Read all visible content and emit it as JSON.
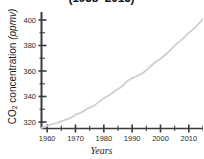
{
  "chart_data": {
    "type": "line",
    "title": "(1958–2015)",
    "xlabel": "Years",
    "ylabel": "CO2 concentration (ppmv)",
    "ylabel_parts": {
      "prefix": "CO",
      "subscript": "2",
      "middle": " concentration ",
      "unit": "(ppmv)"
    },
    "xlim": [
      1958,
      2015
    ],
    "ylim": [
      316,
      410
    ],
    "grid": false,
    "legend": null,
    "line_color": "#cfcfcf",
    "axis_color": "#3a3a3a",
    "x_major_ticks": [
      1960,
      1970,
      1980,
      1990,
      2000,
      2010
    ],
    "x_minor_step": 5,
    "y_major_ticks": [
      320,
      340,
      360,
      380,
      400
    ],
    "y_minor_step": 10,
    "x_tick_labels": [
      "1960",
      "1970",
      "1980",
      "1990",
      "2000",
      "2010"
    ],
    "y_tick_labels": [
      "320",
      "340",
      "360",
      "380",
      "400"
    ],
    "x": [
      1958,
      1960,
      1962,
      1964,
      1966,
      1968,
      1970,
      1972,
      1974,
      1976,
      1978,
      1980,
      1982,
      1984,
      1986,
      1988,
      1990,
      1992,
      1994,
      1996,
      1998,
      2000,
      2002,
      2004,
      2006,
      2008,
      2010,
      2012,
      2015
    ],
    "values": [
      315.3,
      316.9,
      318.4,
      319.6,
      321.4,
      323.0,
      325.7,
      327.5,
      330.2,
      332.1,
      335.4,
      338.7,
      341.2,
      344.4,
      347.2,
      351.6,
      354.4,
      356.4,
      358.8,
      362.6,
      366.7,
      369.6,
      373.3,
      377.5,
      381.9,
      385.6,
      389.9,
      393.8,
      400.8
    ],
    "series_name": "Atmospheric CO2 concentration"
  }
}
